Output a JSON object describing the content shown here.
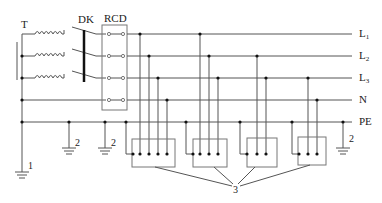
{
  "diagram": {
    "type": "TN-S power distribution with residual current device",
    "labels": {
      "transformer": "T",
      "switch": "DK",
      "rcd": "RCD",
      "earth_source": "1",
      "earth_repeat_a": "2",
      "earth_repeat_b": "2",
      "earth_repeat_c": "2",
      "equipment": "3"
    },
    "buses": [
      {
        "name": "L1",
        "base": "L",
        "sub": "1",
        "y": 34
      },
      {
        "name": "L2",
        "base": "L",
        "sub": "2",
        "y": 56
      },
      {
        "name": "L3",
        "base": "L",
        "sub": "3",
        "y": 78
      },
      {
        "name": "N",
        "base": "N",
        "sub": "",
        "y": 100
      },
      {
        "name": "PE",
        "base": "PE",
        "sub": "",
        "y": 122
      }
    ],
    "loads": [
      {
        "id": "load-1",
        "connections": [
          "PE",
          "L1",
          "L2",
          "L3",
          "N"
        ]
      },
      {
        "id": "load-2",
        "connections": [
          "PE",
          "L1",
          "L2",
          "L3"
        ]
      },
      {
        "id": "load-3",
        "connections": [
          "PE",
          "L2",
          "L3"
        ]
      },
      {
        "id": "load-4",
        "connections": [
          "PE",
          "L3",
          "N"
        ]
      }
    ],
    "colors": {
      "line": "#555555",
      "box": "#777777",
      "dot": "#111111"
    }
  }
}
